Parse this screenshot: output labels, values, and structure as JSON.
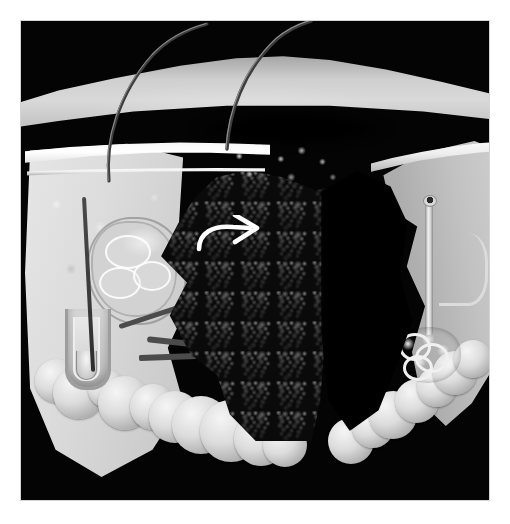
{
  "figure": {
    "domain": "medical-illustration",
    "medium": "halftone scanned print",
    "palette": {
      "paper": "#ffffff",
      "plate_background": "#040404",
      "epidermis": "#f6f6f6",
      "dermis_light": "#dcdcdc",
      "dermis_mid": "#b8b8b8",
      "fat_lobule": "#dcdcdc",
      "tumor_mass": "#0a0a0a",
      "cavity": "#000000",
      "annotation": "#ffffff",
      "hair": "#3a3a3a"
    },
    "canvas": {
      "width": 510,
      "height": 524
    },
    "plate": {
      "x": 21,
      "y": 21,
      "width": 468,
      "height": 479
    },
    "caption": "",
    "title": ""
  },
  "annotations": [
    {
      "name": "curved-arrow",
      "shape": "curved arrow with hooked tail",
      "color": "#ffffff",
      "points_to": "right",
      "x": 172,
      "y": 194,
      "width": 70,
      "height": 42,
      "label": ""
    }
  ],
  "structures": {
    "top_surface": {
      "label": "skin surface",
      "tone": "#cfcfcf"
    },
    "left_face": {
      "label": "left cut face (dermis)",
      "tone": "#dcdcdc"
    },
    "right_face": {
      "label": "right cut face (dermis)",
      "tone": "#bdbdbd"
    },
    "epidermis_band": {
      "label": "epidermis",
      "tone": "#fdfdfd"
    },
    "hair_follicle": {
      "label": "hair follicle with sebaceous gland",
      "side": "left"
    },
    "sweat_gland": {
      "label": "eccrine sweat gland and duct",
      "side": "right"
    },
    "fat_layer": {
      "label": "subcutaneous fat lobules",
      "position": "bottom"
    },
    "lesion": {
      "label": "dark nodular tumour mass",
      "position": "centre"
    },
    "cavity": {
      "label": "deep shadowed cavity",
      "position": "centre-right"
    },
    "hairs": [
      {
        "label": "hair shaft",
        "side": "left"
      },
      {
        "label": "hair shaft",
        "side": "right"
      }
    ]
  },
  "fat_lobules": {
    "left_band": [
      {
        "x": 36,
        "y": 360,
        "r": 22
      },
      {
        "x": 58,
        "y": 372,
        "r": 26
      },
      {
        "x": 86,
        "y": 368,
        "r": 19
      },
      {
        "x": 104,
        "y": 382,
        "r": 27
      },
      {
        "x": 132,
        "y": 386,
        "r": 23
      },
      {
        "x": 154,
        "y": 396,
        "r": 26
      },
      {
        "x": 180,
        "y": 404,
        "r": 29
      },
      {
        "x": 210,
        "y": 410,
        "r": 31
      },
      {
        "x": 240,
        "y": 418,
        "r": 27
      },
      {
        "x": 264,
        "y": 424,
        "r": 22
      }
    ],
    "right_band": [
      {
        "x": 330,
        "y": 420,
        "r": 23
      },
      {
        "x": 352,
        "y": 406,
        "r": 21
      },
      {
        "x": 372,
        "y": 394,
        "r": 24
      },
      {
        "x": 396,
        "y": 380,
        "r": 22
      },
      {
        "x": 416,
        "y": 366,
        "r": 20
      },
      {
        "x": 434,
        "y": 352,
        "r": 22
      },
      {
        "x": 452,
        "y": 338,
        "r": 19
      }
    ]
  }
}
